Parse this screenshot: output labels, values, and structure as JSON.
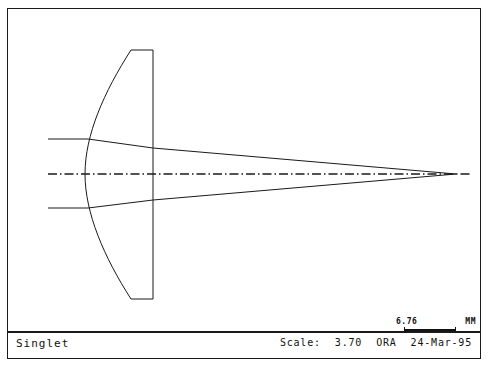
{
  "window": {
    "title": "Singlet"
  },
  "footer": {
    "title": "Singlet",
    "scale_label": "Scale:",
    "scale_value": "3.70",
    "vendor": "ORA",
    "date": "24-Mar-95"
  },
  "scalebar": {
    "value": "6.76",
    "units": "MM"
  },
  "colors": {
    "ink": "#1a1a1a",
    "background": "#ffffff"
  },
  "diagram": {
    "type": "optical-ray-trace",
    "axis": {
      "y": 174,
      "x_start": 47,
      "x_end": 470,
      "style": "dash-dot"
    },
    "lens": {
      "name": "singlet-lens",
      "front_surface": "convex",
      "rear_surface": "plano",
      "rear_face_x": 152,
      "top_y": 50,
      "bottom_y": 299,
      "vertex_x": 84,
      "edge_x": 130
    },
    "rays": [
      {
        "name": "upper-ray",
        "y_in": 139,
        "x_start": 47
      },
      {
        "name": "axial-ray",
        "y_in": 174,
        "x_start": 47
      },
      {
        "name": "lower-ray",
        "y_in": 208,
        "x_start": 47
      }
    ],
    "focus": {
      "x": 455,
      "y": 174
    }
  }
}
